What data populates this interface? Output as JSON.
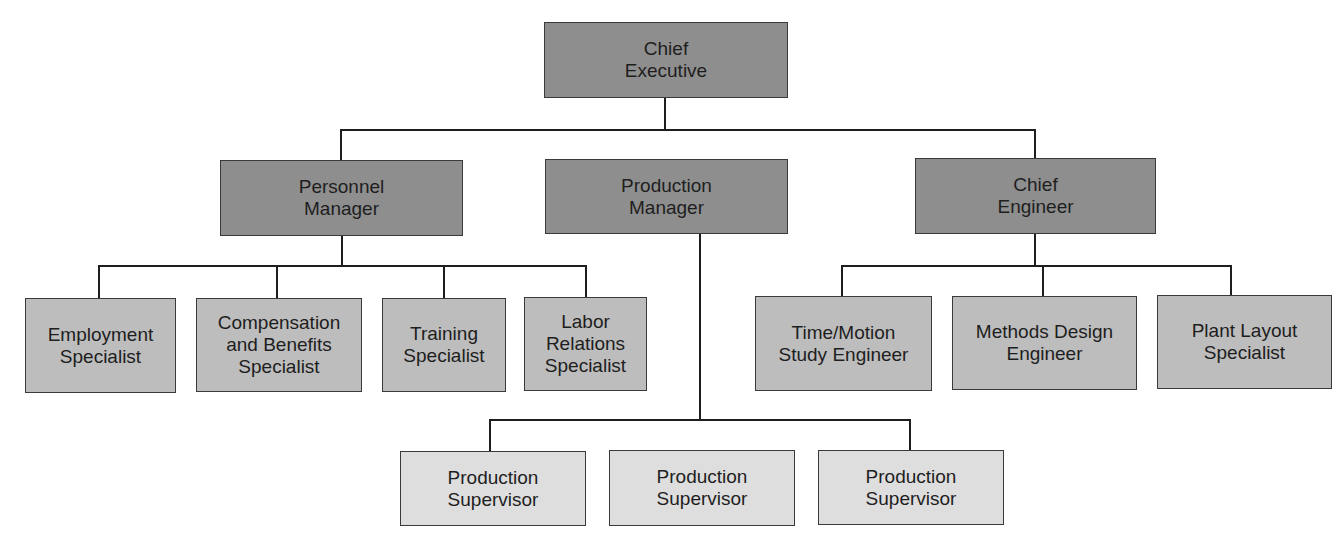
{
  "diagram": {
    "type": "org-chart",
    "colors": {
      "executive": "#8e8e8e",
      "specialist": "#bdbdbd",
      "supervisor": "#dedede",
      "line": "#1e1e1e"
    },
    "nodes": {
      "chief_executive": {
        "label": "Chief\nExecutive",
        "level": 0
      },
      "personnel_manager": {
        "label": "Personnel\nManager",
        "level": 1,
        "parent": "chief_executive"
      },
      "production_manager": {
        "label": "Production\nManager",
        "level": 1,
        "parent": "chief_executive"
      },
      "chief_engineer": {
        "label": "Chief\nEngineer",
        "level": 1,
        "parent": "chief_executive"
      },
      "employment_specialist": {
        "label": "Employment\nSpecialist",
        "level": 2,
        "parent": "personnel_manager"
      },
      "compensation_specialist": {
        "label": "Compensation\nand Benefits\nSpecialist",
        "level": 2,
        "parent": "personnel_manager"
      },
      "training_specialist": {
        "label": "Training\nSpecialist",
        "level": 2,
        "parent": "personnel_manager"
      },
      "labor_relations_specialist": {
        "label": "Labor\nRelations\nSpecialist",
        "level": 2,
        "parent": "personnel_manager"
      },
      "time_motion_engineer": {
        "label": "Time/Motion\nStudy Engineer",
        "level": 2,
        "parent": "chief_engineer"
      },
      "methods_design_engineer": {
        "label": "Methods Design\nEngineer",
        "level": 2,
        "parent": "chief_engineer"
      },
      "plant_layout_specialist": {
        "label": "Plant Layout\nSpecialist",
        "level": 2,
        "parent": "chief_engineer"
      },
      "production_supervisor_1": {
        "label": "Production\nSupervisor",
        "level": 3,
        "parent": "production_manager"
      },
      "production_supervisor_2": {
        "label": "Production\nSupervisor",
        "level": 3,
        "parent": "production_manager"
      },
      "production_supervisor_3": {
        "label": "Production\nSupervisor",
        "level": 3,
        "parent": "production_manager"
      }
    }
  }
}
